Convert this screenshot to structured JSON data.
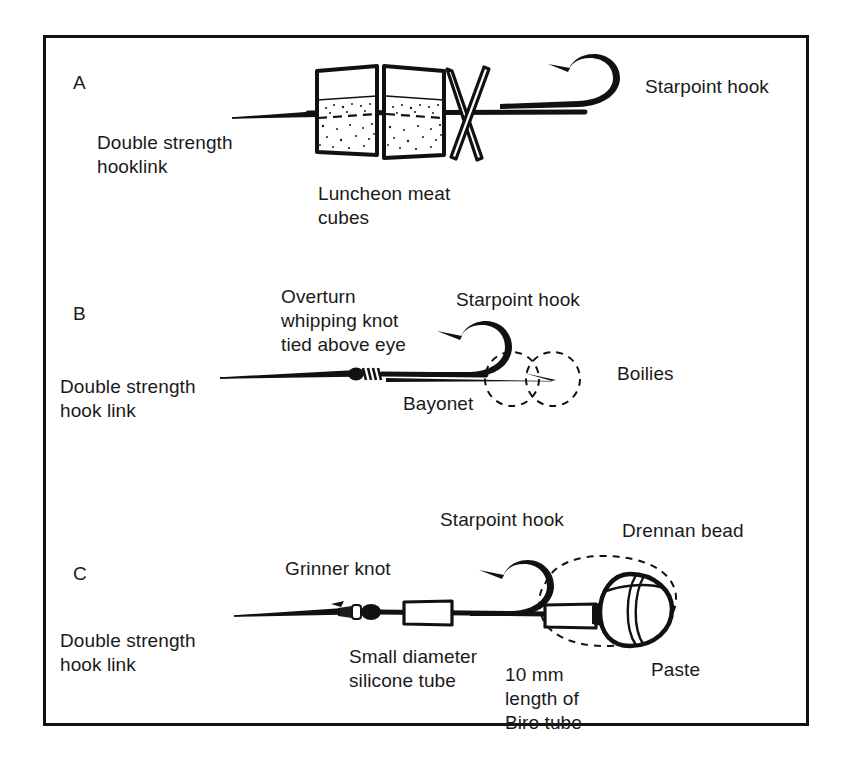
{
  "figure": {
    "background_color": "#ffffff",
    "ink_color": "#111111",
    "border_color": "#111111"
  },
  "panels": [
    {
      "id": "A",
      "letter": "A",
      "labels": {
        "hooklink": "Double strength\nhooklink",
        "bait": "Luncheon meat\ncubes",
        "hook": "Starpoint hook"
      }
    },
    {
      "id": "B",
      "letter": "B",
      "labels": {
        "knot": "Overturn\nwhipping knot\ntied above eye",
        "hook": "Starpoint hook",
        "hooklink": "Double strength\nhook link",
        "bayonet": "Bayonet",
        "bait": "Boilies"
      }
    },
    {
      "id": "C",
      "letter": "C",
      "labels": {
        "hook": "Starpoint hook",
        "bead": "Drennan bead",
        "knot": "Grinner knot",
        "hooklink": "Double strength\nhook link",
        "silicone": "Small diameter\nsilicone tube",
        "biro": "10 mm\nlength of\nBiro tube",
        "paste": "Paste"
      }
    }
  ]
}
